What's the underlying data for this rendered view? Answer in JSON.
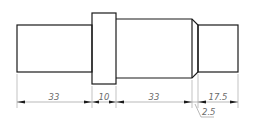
{
  "drawing": {
    "type": "stepped-shaft",
    "line_color": "#1a1a1a",
    "dim_color": "#8a8a8a",
    "segments": [
      {
        "name": "left-cylinder",
        "length": "33"
      },
      {
        "name": "collar",
        "length": "10"
      },
      {
        "name": "middle-cylinder",
        "length": "33"
      },
      {
        "name": "right-cylinder",
        "length": "17.5"
      }
    ],
    "dimensions": {
      "d1": "33",
      "d2": "10",
      "d3": "33",
      "d4": "17.5",
      "chamfer": "2.5"
    }
  }
}
